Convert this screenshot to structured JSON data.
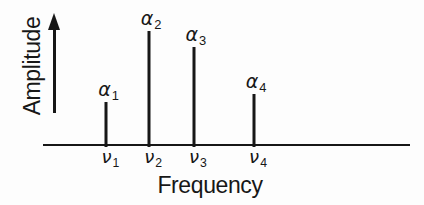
{
  "colors": {
    "ink": "#171717",
    "background": "#fdfdfd"
  },
  "chart_data": {
    "type": "stem",
    "title": "",
    "xlabel": "Frequency",
    "ylabel": "Amplitude",
    "grid": false,
    "legend": false,
    "y_axis_style": "arrow-up-no-ticks",
    "x_axis_style": "plain-line-no-ticks",
    "categories": [
      "ν1",
      "ν2",
      "ν3",
      "ν4"
    ],
    "amplitude_labels": [
      "α1",
      "α2",
      "α3",
      "α4"
    ],
    "relative_heights": [
      0.38,
      1.0,
      0.86,
      0.45
    ],
    "stems": [
      {
        "freq_base": "ν",
        "freq_sub": "1",
        "amp_base": "α",
        "amp_sub": "1",
        "x_frac": 0.173,
        "relative_height": 0.38
      },
      {
        "freq_base": "ν",
        "freq_sub": "2",
        "amp_base": "α",
        "amp_sub": "2",
        "x_frac": 0.289,
        "relative_height": 1.0
      },
      {
        "freq_base": "ν",
        "freq_sub": "3",
        "amp_base": "α",
        "amp_sub": "3",
        "x_frac": 0.411,
        "relative_height": 0.86
      },
      {
        "freq_base": "ν",
        "freq_sub": "4",
        "amp_base": "α",
        "amp_sub": "4",
        "x_frac": 0.575,
        "relative_height": 0.45
      }
    ]
  }
}
